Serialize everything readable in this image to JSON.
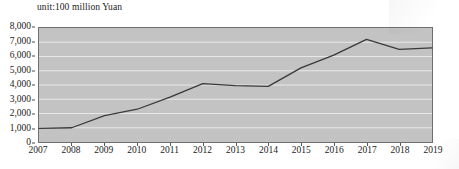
{
  "caption": {
    "unit_text": "unit:100 million Yuan"
  },
  "colors": {
    "plot_background": "#c3c3c3",
    "gridline": "#e8e8e8",
    "plot_border": "#6f6f6f",
    "line_series": "#3a3a3a",
    "text": "#1b1b1b",
    "page_background": "#ffffff"
  },
  "chart_data": {
    "type": "line",
    "title": "unit:100 million Yuan",
    "xlabel": "",
    "ylabel": "",
    "ylim": [
      0,
      8000
    ],
    "yticks": [
      0,
      1000,
      2000,
      3000,
      4000,
      5000,
      6000,
      7000,
      8000
    ],
    "ytick_labels": [
      "0",
      "1,000",
      "2,000",
      "3,000",
      "4,000",
      "5,000",
      "6,000",
      "7,000",
      "8,000"
    ],
    "grid": true,
    "legend": false,
    "categories": [
      "2007",
      "2008",
      "2009",
      "2010",
      "2011",
      "2012",
      "2013",
      "2014",
      "2015",
      "2016",
      "2017",
      "2018",
      "2019"
    ],
    "values": [
      950,
      1000,
      1850,
      2300,
      3150,
      4100,
      3950,
      3900,
      5200,
      6100,
      7200,
      6500,
      6600
    ]
  }
}
